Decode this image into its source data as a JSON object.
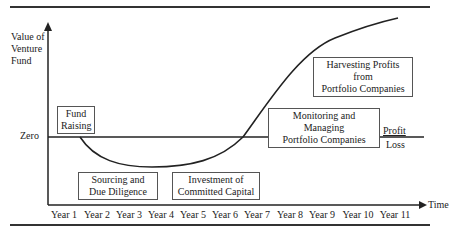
{
  "diagram": {
    "y_axis_label": "Value of Venture Fund",
    "x_axis_label": "Time",
    "zero_label": "Zero",
    "profit_label": "Profit",
    "loss_label": "Loss",
    "x_ticks": [
      "Year 1",
      "Year 2",
      "Year 3",
      "Year 4",
      "Year 5",
      "Year 6",
      "Year 7",
      "Year 8",
      "Year 9",
      "Year 10",
      "Year 11"
    ],
    "stages": {
      "fund_raising": "Fund Raising",
      "sourcing": "Sourcing and Due Diligence",
      "investment": "Investment of Committed Capital",
      "monitoring": "Monitoring and Managing Portfolio Companies",
      "harvesting": "Harvesting Profits from Portfolio Companies"
    },
    "stage_lines": {
      "fund_raising": [
        "Fund",
        "Raising"
      ],
      "sourcing": [
        "Sourcing and",
        "Due Diligence"
      ],
      "investment": [
        "Investment of",
        "Committed Capital"
      ],
      "monitoring": [
        "Monitoring and Managing",
        "Portfolio Companies"
      ],
      "harvesting": [
        "Harvesting Profits from",
        "Portfolio Companies"
      ]
    },
    "colors": {
      "line": "#222222",
      "box_border": "#555555",
      "background": "#ffffff"
    }
  }
}
